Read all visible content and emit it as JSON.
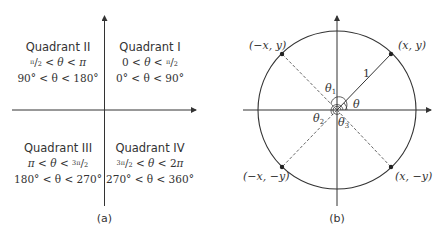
{
  "panel_a": {
    "caption": "(a)",
    "quadrants": [
      {
        "name": "Quadrant II",
        "radian_range": "π/2 < θ < π",
        "degree_range": "90° < θ < 180°"
      },
      {
        "name": "Quadrant I",
        "radian_range": "0 < θ < π/2",
        "degree_range": "0° < θ < 90°"
      },
      {
        "name": "Quadrant III",
        "radian_range": "π < θ < 3π/2",
        "degree_range": "180° < θ < 270°"
      },
      {
        "name": "Quadrant IV",
        "radian_range": "3π/2 < θ < 2π",
        "degree_range": "270° < θ < 360°"
      }
    ]
  },
  "panel_b": {
    "caption": "(b)",
    "points": [
      {
        "label": "(x, y)"
      },
      {
        "label": "(−x, y)"
      },
      {
        "label": "(−x, −y)"
      },
      {
        "label": "(x, −y)"
      }
    ],
    "radius_label": "1",
    "angle_labels": [
      "θ",
      "θ1",
      "θ2",
      "θ3"
    ]
  },
  "colors": {
    "stroke": "#333333",
    "background": "#ffffff"
  }
}
